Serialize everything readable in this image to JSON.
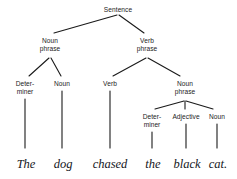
{
  "diagram": {
    "type": "syntax-tree",
    "background_color": "#ffffff",
    "line_color": "#1a1a1a",
    "label_color": "#1c1c1c",
    "leaf_color": "#14161c",
    "nodes": [
      {
        "id": "s",
        "label": "Sentence",
        "x": 118,
        "y": 6,
        "lines": [
          "Sentence"
        ]
      },
      {
        "id": "np1",
        "label": "Noun phrase",
        "x": 50,
        "y": 37,
        "lines": [
          "Noun",
          "phrase"
        ]
      },
      {
        "id": "vp",
        "label": "Verb phrase",
        "x": 147,
        "y": 37,
        "lines": [
          "Verb",
          "phrase"
        ]
      },
      {
        "id": "det1",
        "label": "Determiner",
        "x": 25,
        "y": 80,
        "lines": [
          "Deter-",
          "miner"
        ]
      },
      {
        "id": "n1",
        "label": "Noun",
        "x": 62,
        "y": 80,
        "lines": [
          "Noun"
        ]
      },
      {
        "id": "v",
        "label": "Verb",
        "x": 110,
        "y": 80,
        "lines": [
          "Verb"
        ]
      },
      {
        "id": "np2",
        "label": "Noun phrase",
        "x": 185,
        "y": 80,
        "lines": [
          "Noun",
          "phrase"
        ]
      },
      {
        "id": "det2",
        "label": "Determiner",
        "x": 152,
        "y": 113,
        "lines": [
          "Deter-",
          "miner"
        ]
      },
      {
        "id": "adj",
        "label": "Adjective",
        "x": 186,
        "y": 113,
        "lines": [
          "Adjective"
        ]
      },
      {
        "id": "n2",
        "label": "Noun",
        "x": 217,
        "y": 113,
        "lines": [
          "Noun"
        ]
      }
    ],
    "leaves": [
      {
        "id": "w1",
        "text": "The",
        "x": 26,
        "y": 158
      },
      {
        "id": "w2",
        "text": "dog",
        "x": 63,
        "y": 158
      },
      {
        "id": "w3",
        "text": "chased",
        "x": 110,
        "y": 158
      },
      {
        "id": "w4",
        "text": "the",
        "x": 153,
        "y": 158
      },
      {
        "id": "w5",
        "text": "black",
        "x": 187,
        "y": 158
      },
      {
        "id": "w6",
        "text": "cat.",
        "x": 218,
        "y": 158
      }
    ],
    "edges": [
      {
        "from": "s",
        "to": "np1",
        "x1": 117,
        "y1": 15,
        "x2": 54,
        "y2": 33
      },
      {
        "from": "s",
        "to": "vp",
        "x1": 119,
        "y1": 15,
        "x2": 144,
        "y2": 33
      },
      {
        "from": "np1",
        "to": "det1",
        "x1": 49,
        "y1": 58,
        "x2": 29,
        "y2": 76
      },
      {
        "from": "np1",
        "to": "n1",
        "x1": 51,
        "y1": 58,
        "x2": 61,
        "y2": 76
      },
      {
        "from": "vp",
        "to": "v",
        "x1": 146,
        "y1": 58,
        "x2": 113,
        "y2": 76
      },
      {
        "from": "vp",
        "to": "np2",
        "x1": 148,
        "y1": 58,
        "x2": 180,
        "y2": 76
      },
      {
        "from": "np2",
        "to": "det2",
        "x1": 184,
        "y1": 101,
        "x2": 155,
        "y2": 109
      },
      {
        "from": "np2",
        "to": "adj",
        "x1": 185,
        "y1": 101,
        "x2": 185,
        "y2": 109
      },
      {
        "from": "np2",
        "to": "n2",
        "x1": 186,
        "y1": 101,
        "x2": 213,
        "y2": 109
      },
      {
        "from": "det1",
        "to": "w1",
        "x1": 25,
        "y1": 99,
        "x2": 25,
        "y2": 148
      },
      {
        "from": "n1",
        "to": "w2",
        "x1": 62,
        "y1": 91,
        "x2": 62,
        "y2": 148
      },
      {
        "from": "v",
        "to": "w3",
        "x1": 110,
        "y1": 91,
        "x2": 110,
        "y2": 148
      },
      {
        "from": "det2",
        "to": "w4",
        "x1": 152,
        "y1": 132,
        "x2": 152,
        "y2": 148
      },
      {
        "from": "adj",
        "to": "w5",
        "x1": 186,
        "y1": 124,
        "x2": 186,
        "y2": 148
      },
      {
        "from": "n2",
        "to": "w6",
        "x1": 217,
        "y1": 124,
        "x2": 217,
        "y2": 148
      }
    ]
  }
}
